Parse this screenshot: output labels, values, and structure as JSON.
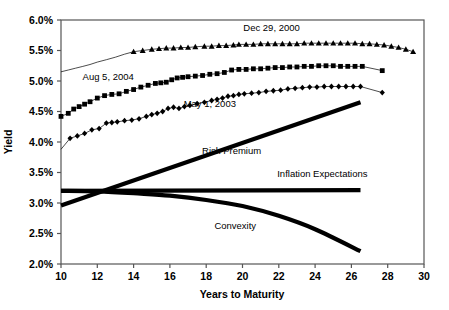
{
  "chart_data": {
    "type": "line",
    "title": "",
    "xlabel": "Years to Maturity",
    "ylabel": "Yield",
    "xlim": [
      10,
      30
    ],
    "ylim": [
      2.0,
      6.0
    ],
    "xticks": [
      "10",
      "12",
      "14",
      "16",
      "18",
      "20",
      "22",
      "24",
      "26",
      "28",
      "30"
    ],
    "yticks": [
      "2.0%",
      "2.5%",
      "3.0%",
      "3.5%",
      "4.0%",
      "4.5%",
      "5.0%",
      "5.5%",
      "6.0%"
    ],
    "grid": false,
    "legend": "inline-annotations",
    "series": [
      {
        "name": "Dec 29, 2000",
        "marker": "triangle",
        "label_x": 21.6,
        "label_y": 5.82,
        "x": [
          10.0,
          10.4,
          10.8,
          11.2,
          11.6,
          12.0,
          12.5,
          13.0,
          13.5,
          14.0,
          14.5,
          15.0,
          15.4,
          15.8,
          16.2,
          16.6,
          17.0,
          17.4,
          17.9,
          18.3,
          18.7,
          19.1,
          19.5,
          19.8,
          20.2,
          20.6,
          21.0,
          21.4,
          21.8,
          22.2,
          22.6,
          23.0,
          23.4,
          23.8,
          24.2,
          24.6,
          25.0,
          25.4,
          25.8,
          26.2,
          26.6,
          27.0,
          27.4,
          27.8,
          28.2,
          28.6,
          29.0,
          29.4
        ],
        "y": [
          5.15,
          5.18,
          5.21,
          5.24,
          5.27,
          5.31,
          5.35,
          5.39,
          5.44,
          5.48,
          5.5,
          5.52,
          5.53,
          5.54,
          5.54,
          5.55,
          5.55,
          5.56,
          5.57,
          5.57,
          5.58,
          5.58,
          5.59,
          5.6,
          5.6,
          5.6,
          5.61,
          5.61,
          5.61,
          5.61,
          5.61,
          5.61,
          5.62,
          5.62,
          5.62,
          5.62,
          5.62,
          5.62,
          5.62,
          5.62,
          5.61,
          5.61,
          5.6,
          5.59,
          5.57,
          5.55,
          5.52,
          5.48
        ],
        "marker_start_x": 14.0
      },
      {
        "name": "Aug 5, 2004",
        "marker": "square",
        "label_x": 12.6,
        "label_y": 5.01,
        "x": [
          10.0,
          10.4,
          10.7,
          11.0,
          11.3,
          11.6,
          12.0,
          12.4,
          12.8,
          13.2,
          13.6,
          14.0,
          14.4,
          14.8,
          15.2,
          15.5,
          15.8,
          16.1,
          16.4,
          16.7,
          17.0,
          17.4,
          17.8,
          18.2,
          18.6,
          19.0,
          19.4,
          19.8,
          20.2,
          20.6,
          21.0,
          21.4,
          21.8,
          22.2,
          22.6,
          23.0,
          23.4,
          23.8,
          24.2,
          24.6,
          25.0,
          25.4,
          25.8,
          26.2,
          26.6,
          27.7
        ],
        "y": [
          4.42,
          4.47,
          4.54,
          4.58,
          4.62,
          4.66,
          4.72,
          4.76,
          4.78,
          4.79,
          4.83,
          4.86,
          4.9,
          4.93,
          4.96,
          4.97,
          4.98,
          5.02,
          5.05,
          5.06,
          5.07,
          5.08,
          5.09,
          5.11,
          5.12,
          5.14,
          5.18,
          5.19,
          5.19,
          5.2,
          5.2,
          5.21,
          5.22,
          5.22,
          5.23,
          5.23,
          5.24,
          5.24,
          5.25,
          5.25,
          5.25,
          5.24,
          5.24,
          5.24,
          5.24,
          5.17
        ],
        "marker_start_x": 10.0
      },
      {
        "name": "May 1, 2003",
        "marker": "diamond",
        "label_x": 18.2,
        "label_y": 4.57,
        "x": [
          10.0,
          10.5,
          10.9,
          11.3,
          11.7,
          12.1,
          12.5,
          12.8,
          13.1,
          13.5,
          13.9,
          14.3,
          14.7,
          15.0,
          15.3,
          15.6,
          15.9,
          16.2,
          16.5,
          16.8,
          17.1,
          17.5,
          17.9,
          18.3,
          18.6,
          18.9,
          19.2,
          19.5,
          19.8,
          20.1,
          20.5,
          20.9,
          21.3,
          21.7,
          22.1,
          22.5,
          22.9,
          23.3,
          23.7,
          24.1,
          24.5,
          24.9,
          25.3,
          25.7,
          26.1,
          26.5,
          27.7
        ],
        "y": [
          3.88,
          4.06,
          4.1,
          4.14,
          4.2,
          4.22,
          4.31,
          4.32,
          4.33,
          4.35,
          4.36,
          4.38,
          4.42,
          4.45,
          4.47,
          4.5,
          4.55,
          4.57,
          4.55,
          4.58,
          4.6,
          4.63,
          4.65,
          4.68,
          4.7,
          4.72,
          4.75,
          4.76,
          4.78,
          4.79,
          4.8,
          4.81,
          4.83,
          4.84,
          4.85,
          4.87,
          4.88,
          4.89,
          4.9,
          4.9,
          4.91,
          4.91,
          4.91,
          4.91,
          4.91,
          4.91,
          4.81
        ],
        "marker_start_x": 10.5
      }
    ],
    "curves": [
      {
        "name": "Risk Premium",
        "style": "thick-straight",
        "label_x": 19.4,
        "label_y": 3.8,
        "x": [
          10.0,
          26.5
        ],
        "y": [
          2.96,
          4.65
        ]
      },
      {
        "name": "Inflation Expectations",
        "style": "thick-straight",
        "label_x": 24.4,
        "label_y": 3.42,
        "x": [
          10.0,
          26.5
        ],
        "y": [
          3.2,
          3.21
        ]
      },
      {
        "name": "Convexity",
        "style": "thick-curve",
        "label_x": 19.6,
        "label_y": 2.58,
        "x": [
          10.0,
          12.0,
          14.0,
          16.0,
          18.0,
          20.0,
          22.0,
          24.0,
          26.5
        ],
        "y": [
          3.2,
          3.19,
          3.16,
          3.12,
          3.05,
          2.95,
          2.79,
          2.57,
          2.21
        ]
      }
    ]
  }
}
